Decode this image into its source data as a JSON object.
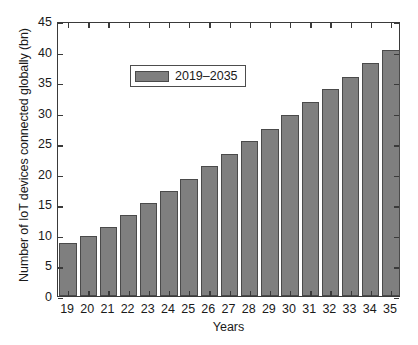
{
  "chart_data": {
    "type": "bar",
    "title": "",
    "xlabel": "Years",
    "ylabel": "Number of IoT devices connected globally (bn)",
    "categories": [
      "19",
      "20",
      "21",
      "22",
      "23",
      "24",
      "25",
      "26",
      "27",
      "28",
      "29",
      "30",
      "31",
      "32",
      "33",
      "34",
      "35"
    ],
    "values": [
      8.6,
      9.8,
      11.3,
      13.2,
      15.2,
      17.2,
      19.2,
      21.2,
      23.3,
      25.3,
      27.4,
      29.6,
      31.8,
      33.8,
      35.9,
      38.2,
      40.2
    ],
    "series": [
      {
        "name": "2019–2035",
        "values": [
          8.6,
          9.8,
          11.3,
          13.2,
          15.2,
          17.2,
          19.2,
          21.2,
          23.3,
          25.3,
          27.4,
          29.6,
          31.8,
          33.8,
          35.9,
          38.2,
          40.2
        ]
      }
    ],
    "ylim": [
      0,
      45
    ],
    "yticks": [
      0,
      5,
      10,
      15,
      20,
      25,
      30,
      35,
      40,
      45
    ],
    "ytick_labels": [
      "0",
      "5",
      "10",
      "15",
      "20",
      "25",
      "30",
      "35",
      "40",
      "45"
    ],
    "xtick_labels": [
      "19",
      "20",
      "21",
      "22",
      "23",
      "24",
      "25",
      "26",
      "27",
      "28",
      "29",
      "30",
      "31",
      "32",
      "33",
      "34",
      "35"
    ],
    "grid": false,
    "legend": {
      "position": "top-left",
      "entries": [
        "2019–2035"
      ]
    },
    "bar_color": "#7f7f7f",
    "bar_edge_color": "#4a4a4a",
    "axis_color": "#3a3a3a",
    "background_color": "#ffffff"
  }
}
